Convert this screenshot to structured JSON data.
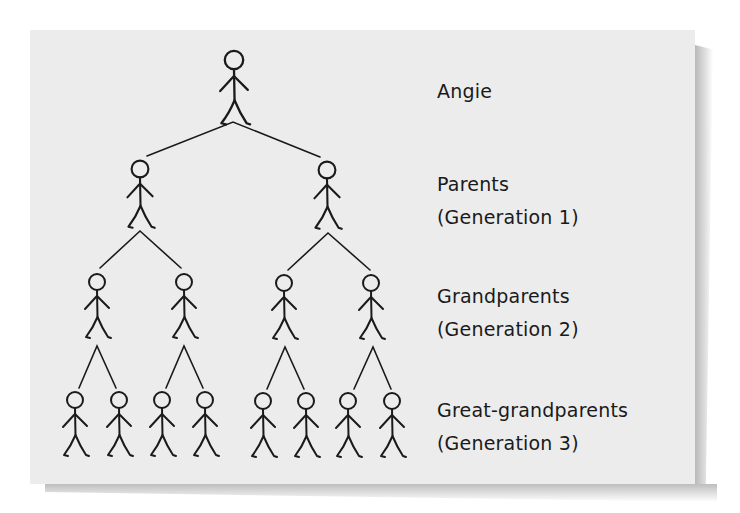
{
  "colors": {
    "card_background": "#ececec",
    "ink": "#1a1a1a",
    "page_background": "#ffffff"
  },
  "generations": [
    {
      "name": "Angie",
      "subtitle": null,
      "label_top": 75
    },
    {
      "name": "Parents",
      "subtitle": "(Generation 1)",
      "label_top": 168
    },
    {
      "name": "Grandparents",
      "subtitle": "(Generation 2)",
      "label_top": 280
    },
    {
      "name": "Great-grandparents",
      "subtitle": "(Generation 3)",
      "label_top": 394
    }
  ],
  "labels": {
    "gen0_line1": "Angie",
    "gen1_line1": "Parents",
    "gen1_line2": "(Generation 1)",
    "gen2_line1": "Grandparents",
    "gen2_line2": "(Generation 2)",
    "gen3_line1": "Great-grandparents",
    "gen3_line2": "(Generation 3)"
  },
  "figures": [
    {
      "id": "angie",
      "generation": 0,
      "x": 234,
      "y": 60,
      "scale": 1.15
    },
    {
      "id": "parent-1",
      "generation": 1,
      "x": 140,
      "y": 169,
      "scale": 1.05
    },
    {
      "id": "parent-2",
      "generation": 1,
      "x": 327,
      "y": 170,
      "scale": 1.05
    },
    {
      "id": "grandparent-1",
      "generation": 2,
      "x": 97,
      "y": 282,
      "scale": 1.0
    },
    {
      "id": "grandparent-2",
      "generation": 2,
      "x": 184,
      "y": 282,
      "scale": 1.0
    },
    {
      "id": "grandparent-3",
      "generation": 2,
      "x": 284,
      "y": 283,
      "scale": 1.0
    },
    {
      "id": "grandparent-4",
      "generation": 2,
      "x": 371,
      "y": 283,
      "scale": 1.0
    },
    {
      "id": "great-grandparent-1",
      "generation": 3,
      "x": 75,
      "y": 400,
      "scale": 1.0
    },
    {
      "id": "great-grandparent-2",
      "generation": 3,
      "x": 119,
      "y": 400,
      "scale": 1.0
    },
    {
      "id": "great-grandparent-3",
      "generation": 3,
      "x": 162,
      "y": 400,
      "scale": 1.0
    },
    {
      "id": "great-grandparent-4",
      "generation": 3,
      "x": 205,
      "y": 400,
      "scale": 1.0
    },
    {
      "id": "great-grandparent-5",
      "generation": 3,
      "x": 263,
      "y": 401,
      "scale": 1.0
    },
    {
      "id": "great-grandparent-6",
      "generation": 3,
      "x": 306,
      "y": 401,
      "scale": 1.0
    },
    {
      "id": "great-grandparent-7",
      "generation": 3,
      "x": 348,
      "y": 401,
      "scale": 1.0
    },
    {
      "id": "great-grandparent-8",
      "generation": 3,
      "x": 392,
      "y": 401,
      "scale": 1.0
    }
  ],
  "connectors": [
    {
      "from": "angie",
      "apex": [
        233,
        122
      ],
      "ends": [
        [
          147,
          156
        ],
        [
          320,
          157
        ]
      ]
    },
    {
      "from": "parent-1",
      "apex": [
        140,
        231
      ],
      "ends": [
        [
          100,
          268
        ],
        [
          181,
          268
        ]
      ]
    },
    {
      "from": "parent-2",
      "apex": [
        328,
        233
      ],
      "ends": [
        [
          288,
          270
        ],
        [
          370,
          270
        ]
      ]
    },
    {
      "from": "grandparent-1",
      "apex": [
        97,
        346
      ],
      "ends": [
        [
          79,
          388
        ],
        [
          116,
          388
        ]
      ]
    },
    {
      "from": "grandparent-2",
      "apex": [
        184,
        346
      ],
      "ends": [
        [
          166,
          388
        ],
        [
          203,
          388
        ]
      ]
    },
    {
      "from": "grandparent-3",
      "apex": [
        285,
        347
      ],
      "ends": [
        [
          267,
          389
        ],
        [
          304,
          389
        ]
      ]
    },
    {
      "from": "grandparent-4",
      "apex": [
        373,
        347
      ],
      "ends": [
        [
          354,
          389
        ],
        [
          391,
          389
        ]
      ]
    }
  ]
}
